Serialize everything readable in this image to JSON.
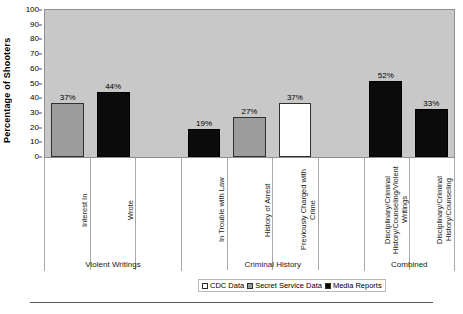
{
  "chart_data": {
    "type": "bar",
    "title": "",
    "xlabel": "",
    "ylabel": "Percentage of Shooters",
    "ylim": [
      0,
      100
    ],
    "ytick_step": 10,
    "yticks": [
      "100",
      "90",
      "80",
      "70",
      "60",
      "50",
      "40",
      "30",
      "20",
      "10",
      "0"
    ],
    "grid": false,
    "legend_position": "bottom-right",
    "legend": [
      {
        "label": "CDC Data",
        "swatch": "white-square-icon",
        "color": "#ffffff"
      },
      {
        "label": "Secret Service Data",
        "swatch": "gray-square-icon",
        "color": "#9c9c9c"
      },
      {
        "label": "Media Reports",
        "swatch": "black-square-icon",
        "color": "#0b0b0b"
      }
    ],
    "groups": [
      {
        "label": "Violent Writings",
        "slots": 3
      },
      {
        "label": "Criminal History",
        "slots": 4
      },
      {
        "label": "Combined",
        "slots": 2
      }
    ],
    "categories": [
      "Interest In",
      "Wrote",
      "",
      "In Trouble with Law",
      "History of Arrest",
      "Previously Charged with Crime",
      "",
      "Disciplinary/Criminal History/Counseling/Violent Writings",
      "Disciplinary/Criminal History/Counseling"
    ],
    "bars": [
      {
        "category": "Interest In",
        "value": 37,
        "label": "37%",
        "series": "Secret Service Data",
        "style": "ss"
      },
      {
        "category": "Wrote",
        "value": 44,
        "label": "44%",
        "series": "Media Reports",
        "style": "mr"
      },
      {
        "category": "",
        "value": null,
        "label": "",
        "series": "",
        "style": "none"
      },
      {
        "category": "In Trouble with Law",
        "value": 19,
        "label": "19%",
        "series": "Media Reports",
        "style": "mr"
      },
      {
        "category": "History of Arrest",
        "value": 27,
        "label": "27%",
        "series": "Secret Service Data",
        "style": "ss"
      },
      {
        "category": "Previously Charged with Crime",
        "value": 37,
        "label": "37%",
        "series": "CDC Data",
        "style": "cdc"
      },
      {
        "category": "",
        "value": null,
        "label": "",
        "series": "",
        "style": "none"
      },
      {
        "category": "Disciplinary/Criminal History/Counseling/Violent Writings",
        "value": 52,
        "label": "52%",
        "series": "Media Reports",
        "style": "mr"
      },
      {
        "category": "Disciplinary/Criminal History/Counseling",
        "value": 33,
        "label": "33%",
        "series": "Media Reports",
        "style": "mr"
      }
    ]
  },
  "axis": {
    "ylabel": "Percentage of Shooters"
  },
  "colors": {
    "plot_background": "#c8c8c8",
    "series_cdc": "#ffffff",
    "series_secret_service": "#9c9c9c",
    "series_media_reports": "#0b0b0b",
    "grid_line": "#a9a9a9",
    "frame": "#8f8f8f"
  }
}
